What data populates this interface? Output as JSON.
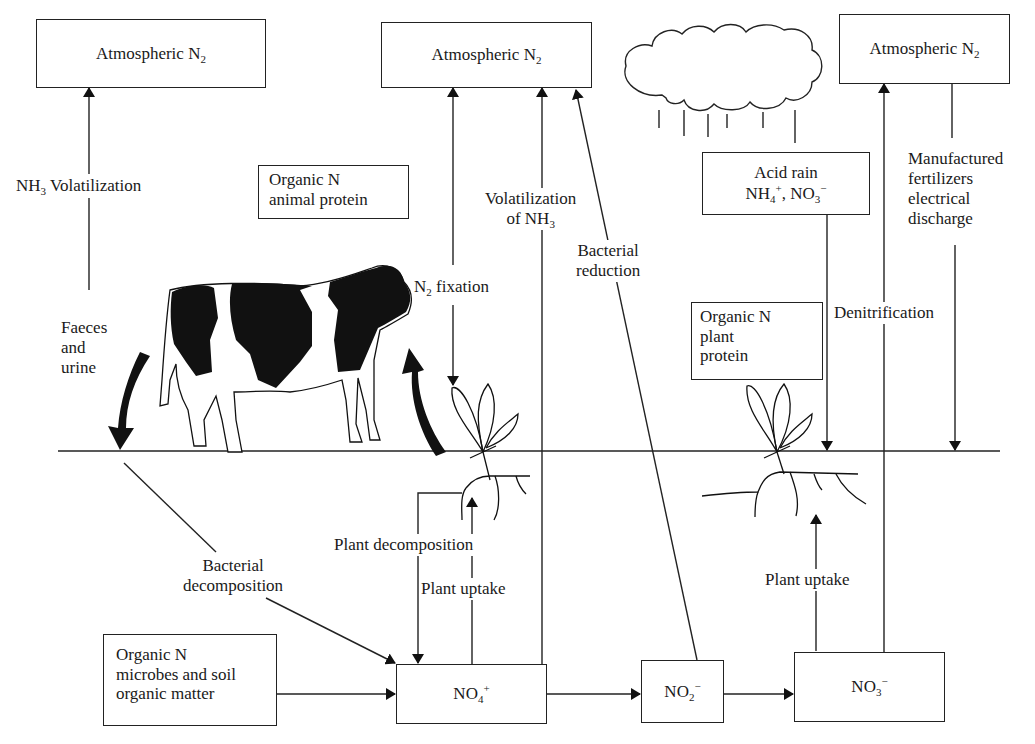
{
  "diagram": {
    "colors": {
      "line": "#222222",
      "background": "#ffffff",
      "fill": "#111111"
    }
  },
  "boxes": {
    "atmos_left": {
      "text": "Atmospheric N",
      "sub": "2"
    },
    "atmos_middle": {
      "text": "Atmospheric N",
      "sub": "2"
    },
    "atmos_right": {
      "text": "Atmospheric N",
      "sub": "2"
    },
    "organic_animal": {
      "line1": "Organic N",
      "line2": "animal protein"
    },
    "acid_rain": {
      "line1": "Acid rain",
      "line2_a": "NH",
      "line2_a_sub": "4",
      "line2_a_sup": "+",
      "line2_sep": ", NO",
      "line2_b_sub": "3",
      "line2_b_sup": "−"
    },
    "organic_plant": {
      "line1": "Organic N",
      "line2": "plant",
      "line3": "protein"
    },
    "organic_soil": {
      "line1": "Organic N",
      "line2": "microbes and soil",
      "line3": "organic matter"
    },
    "no4": {
      "text": "NO",
      "sub": "4",
      "sup": "+"
    },
    "no2": {
      "text": "NO",
      "sub": "2",
      "sup": "−"
    },
    "no3": {
      "text": "NO",
      "sub": "3",
      "sup": "−"
    }
  },
  "labels": {
    "nh3_volatilization": {
      "pre": "NH",
      "sub": "3",
      "post": " Volatilization"
    },
    "faeces": {
      "line1": "Faeces",
      "line2": "and",
      "line3": "urine"
    },
    "n2_fixation": {
      "pre": "N",
      "sub": "2",
      "post": " fixation"
    },
    "volatilization_nh3": {
      "line1": "Volatilization",
      "line2_pre": "of NH",
      "line2_sub": "3"
    },
    "bacterial_reduction": {
      "line1": "Bacterial",
      "line2": "reduction"
    },
    "manufactured": {
      "line1": "Manufactured",
      "line2": "fertilizers",
      "line3": "electrical",
      "line4": "discharge"
    },
    "denitrification": "Denitrification",
    "bacterial_decomposition": {
      "line1": "Bacterial",
      "line2": "decomposition"
    },
    "plant_decomposition": "Plant decomposition",
    "plant_uptake_left": "Plant uptake",
    "plant_uptake_right": "Plant uptake"
  },
  "icons": [
    "cow-illustration",
    "cloud-icon",
    "rain-icon",
    "plant-left-icon",
    "plant-right-icon",
    "curved-arrow-down-icon",
    "curved-arrow-up-icon"
  ]
}
